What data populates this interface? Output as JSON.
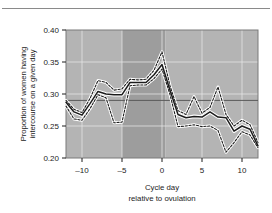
{
  "figure": {
    "top_rule": "horizontal-rule"
  },
  "chart_data": {
    "type": "line",
    "title": "",
    "subtitle": "",
    "xlabel": "Cycle day",
    "xlabel_line2": "relative to ovulation",
    "ylabel": "Proportion of women having",
    "ylabel_line2": "intercourse on a given day",
    "xlim": [
      -12,
      12
    ],
    "ylim": [
      0.2,
      0.4
    ],
    "xticks": [
      -10,
      -5,
      0,
      5,
      10
    ],
    "xtick_labels": [
      "–10",
      "–5",
      "0",
      "5",
      "10"
    ],
    "yticks": [
      0.2,
      0.25,
      0.3,
      0.35,
      0.4
    ],
    "ytick_labels": [
      "0.20",
      "0.25",
      "0.30",
      "0.35",
      "0.40"
    ],
    "grid": true,
    "grid_color": "#e8e8e8",
    "legend": "none",
    "plot_background_bands": [
      {
        "name": "left-band",
        "x_from": -12,
        "x_to": -5,
        "color": "#b4b4b4"
      },
      {
        "name": "fertile-window-band",
        "x_from": -5,
        "x_to": 0.4,
        "color": "#9d9d9d"
      },
      {
        "name": "right-band",
        "x_from": 0.4,
        "x_to": 12,
        "color": "#b4b4b4"
      }
    ],
    "reference_line": {
      "name": "baseline-reference",
      "y": 0.29,
      "color": "#5a5a5a"
    },
    "x": [
      -12,
      -11,
      -10,
      -9,
      -8,
      -7,
      -6,
      -5,
      -4,
      -3,
      -2,
      -1,
      0,
      1,
      2,
      3,
      4,
      5,
      6,
      7,
      8,
      9,
      10,
      11,
      12
    ],
    "series": [
      {
        "name": "Proportion having intercourse (mean)",
        "style": "solid",
        "color": "#1c1c1c",
        "values": [
          0.287,
          0.272,
          0.267,
          0.285,
          0.304,
          0.3,
          0.299,
          0.299,
          0.318,
          0.318,
          0.318,
          0.33,
          0.346,
          0.306,
          0.268,
          0.263,
          0.265,
          0.264,
          0.272,
          0.264,
          0.263,
          0.242,
          0.25,
          0.245,
          0.219
        ]
      },
      {
        "name": "Upper confidence bound",
        "style": "dashed",
        "color": "#1c1c1c",
        "values": [
          0.29,
          0.276,
          0.271,
          0.293,
          0.321,
          0.318,
          0.306,
          0.308,
          0.323,
          0.322,
          0.323,
          0.337,
          0.366,
          0.313,
          0.274,
          0.268,
          0.296,
          0.27,
          0.279,
          0.311,
          0.268,
          0.25,
          0.259,
          0.252,
          0.224
        ]
      },
      {
        "name": "Lower confidence bound",
        "style": "dashed",
        "color": "#1c1c1c",
        "values": [
          0.281,
          0.261,
          0.259,
          0.277,
          0.299,
          0.294,
          0.255,
          0.256,
          0.313,
          0.314,
          0.314,
          0.324,
          0.339,
          0.299,
          0.249,
          0.25,
          0.252,
          0.249,
          0.25,
          0.243,
          0.209,
          0.224,
          0.241,
          0.236,
          0.216
        ]
      }
    ]
  }
}
